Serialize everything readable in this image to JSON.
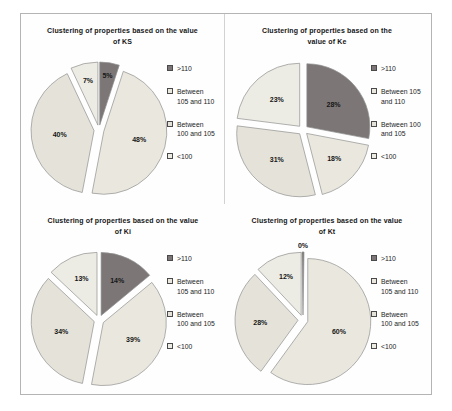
{
  "figure": {
    "background": "#fefefe",
    "border_color": "#b4b4b4"
  },
  "palette": {
    "slice_stroke": "#8f8f8f",
    "label_color": "#161616",
    "dark_series": "#7c7676",
    "light_series_105_110": "#eae8de",
    "light_series_100_105": "#e5e3d9",
    "light_series_lt100": "#edece4"
  },
  "chart_data": [
    {
      "type": "pie",
      "title": "Clustering of properties based on the value of KS",
      "title_lines": [
        "Clustering of properties based on the value",
        "of KS"
      ],
      "legend_position": "right",
      "slices": [
        {
          "label": ">110",
          "legend_lines": [
            ">110"
          ],
          "value": 5,
          "pct_label": "5%",
          "color": "#7c7676",
          "label_r": 0.78
        },
        {
          "label": "Between 105 and 110",
          "legend_lines": [
            "Between",
            "105 and 110"
          ],
          "value": 48,
          "pct_label": "48%",
          "color": "#eae8de",
          "label_r": 0.58
        },
        {
          "label": "Between 100 and 105",
          "legend_lines": [
            "Between",
            "100 and 105"
          ],
          "value": 40,
          "pct_label": "40%",
          "color": "#e5e3d9",
          "label_r": 0.55
        },
        {
          "label": "<100",
          "legend_lines": [
            "<100"
          ],
          "value": 7,
          "pct_label": "7%",
          "color": "#edece4",
          "label_r": 0.72
        }
      ]
    },
    {
      "type": "pie",
      "title": "Clustering of properties based on the value of Ke",
      "title_lines": [
        "Clustering of properties based on the",
        "value of Ke"
      ],
      "legend_position": "right",
      "slices": [
        {
          "label": ">110",
          "legend_lines": [
            ">110"
          ],
          "value": 28,
          "pct_label": "28%",
          "color": "#7c7676",
          "label_r": 0.55
        },
        {
          "label": "Between 105 and 110",
          "legend_lines": [
            "Between 105",
            "and 110"
          ],
          "value": 18,
          "pct_label": "18%",
          "color": "#eae8de",
          "label_r": 0.6
        },
        {
          "label": "Between 100 and 105",
          "legend_lines": [
            "Between 100",
            "and 105"
          ],
          "value": 31,
          "pct_label": "31%",
          "color": "#e5e3d9",
          "label_r": 0.55
        },
        {
          "label": "<100",
          "legend_lines": [
            "<100"
          ],
          "value": 23,
          "pct_label": "23%",
          "color": "#edece4",
          "label_r": 0.55
        }
      ]
    },
    {
      "type": "pie",
      "title": "Clustering of properties based on the value of Ki",
      "title_lines": [
        "Clustering of properties based on the value",
        "of Ki"
      ],
      "legend_position": "right",
      "slices": [
        {
          "label": ">110",
          "legend_lines": [
            ">110"
          ],
          "value": 14,
          "pct_label": "14%",
          "color": "#7c7676",
          "label_r": 0.6
        },
        {
          "label": "Between 105 and 110",
          "legend_lines": [
            "Between",
            "105 and 110"
          ],
          "value": 39,
          "pct_label": "39%",
          "color": "#eae8de",
          "label_r": 0.55
        },
        {
          "label": "Between 100 and 105",
          "legend_lines": [
            "Between",
            "100 and 105"
          ],
          "value": 34,
          "pct_label": "34%",
          "color": "#e5e3d9",
          "label_r": 0.55
        },
        {
          "label": "<100",
          "legend_lines": [
            "<100"
          ],
          "value": 13,
          "pct_label": "13%",
          "color": "#edece4",
          "label_r": 0.62
        }
      ]
    },
    {
      "type": "pie",
      "title": "Clustering of properties based on the value of Kt",
      "title_lines": [
        "Clustering of properties based on the value",
        "of Kt"
      ],
      "legend_position": "right",
      "slices": [
        {
          "label": ">110",
          "legend_lines": [
            ">110"
          ],
          "value": 0,
          "pct_label": "0%",
          "color": "#7c7676",
          "label_r": 1.1,
          "min_deg": 1.8
        },
        {
          "label": "Between 105 and 110",
          "legend_lines": [
            "Between",
            "105 and 110"
          ],
          "value": 60,
          "pct_label": "60%",
          "color": "#eae8de",
          "label_r": 0.52
        },
        {
          "label": "Between 100 and 105",
          "legend_lines": [
            "Between",
            "100 and 105"
          ],
          "value": 28,
          "pct_label": "28%",
          "color": "#e5e3d9",
          "label_r": 0.6
        },
        {
          "label": "<100",
          "legend_lines": [
            "<100"
          ],
          "value": 12,
          "pct_label": "12%",
          "color": "#edece4",
          "label_r": 0.65
        }
      ]
    }
  ]
}
